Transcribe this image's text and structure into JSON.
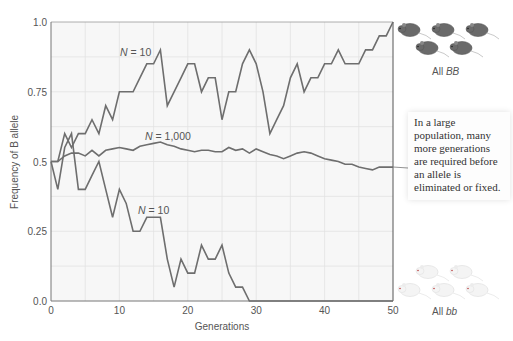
{
  "chart_data": {
    "type": "line",
    "title": "",
    "xlabel": "Generations",
    "ylabel": "Frequency of B allele",
    "xlim": [
      0,
      50
    ],
    "ylim": [
      0.0,
      1.0
    ],
    "x_ticks": [
      "0",
      "10",
      "20",
      "30",
      "40",
      "50"
    ],
    "y_ticks": [
      "0.0",
      "0.25",
      "0.5",
      "0.75",
      "1.0"
    ],
    "grid": true,
    "x": [
      0,
      1,
      2,
      3,
      4,
      5,
      6,
      7,
      8,
      9,
      10,
      11,
      12,
      13,
      14,
      15,
      16,
      17,
      18,
      19,
      20,
      21,
      22,
      23,
      24,
      25,
      26,
      27,
      28,
      29,
      30,
      31,
      32,
      33,
      34,
      35,
      36,
      37,
      38,
      39,
      40,
      41,
      42,
      43,
      44,
      45,
      46,
      47,
      48,
      49,
      50
    ],
    "series": [
      {
        "name": "N = 10 (fixed)",
        "label": "N = 10",
        "values": [
          0.5,
          0.5,
          0.6,
          0.55,
          0.6,
          0.6,
          0.65,
          0.6,
          0.7,
          0.65,
          0.75,
          0.75,
          0.75,
          0.8,
          0.85,
          0.85,
          0.9,
          0.7,
          0.75,
          0.8,
          0.85,
          0.85,
          0.75,
          0.8,
          0.8,
          0.65,
          0.75,
          0.75,
          0.85,
          0.9,
          0.85,
          0.75,
          0.6,
          0.65,
          0.7,
          0.8,
          0.85,
          0.75,
          0.8,
          0.8,
          0.85,
          0.85,
          0.9,
          0.85,
          0.85,
          0.85,
          0.9,
          0.9,
          0.95,
          0.95,
          1.0
        ]
      },
      {
        "name": "N = 1,000",
        "label": "N = 1,000",
        "values": [
          0.5,
          0.5,
          0.52,
          0.53,
          0.53,
          0.52,
          0.54,
          0.52,
          0.54,
          0.545,
          0.55,
          0.545,
          0.54,
          0.555,
          0.56,
          0.565,
          0.57,
          0.56,
          0.555,
          0.545,
          0.54,
          0.535,
          0.54,
          0.54,
          0.535,
          0.535,
          0.55,
          0.54,
          0.545,
          0.53,
          0.545,
          0.535,
          0.525,
          0.52,
          0.51,
          0.52,
          0.53,
          0.535,
          0.53,
          0.52,
          0.51,
          0.505,
          0.5,
          0.49,
          0.49,
          0.48,
          0.475,
          0.47,
          0.48,
          0.48,
          0.48
        ]
      },
      {
        "name": "N = 10 (lost)",
        "label": "N = 10",
        "values": [
          0.5,
          0.4,
          0.55,
          0.6,
          0.4,
          0.4,
          0.45,
          0.5,
          0.4,
          0.3,
          0.4,
          0.35,
          0.25,
          0.25,
          0.3,
          0.3,
          0.3,
          0.15,
          0.05,
          0.15,
          0.1,
          0.1,
          0.2,
          0.15,
          0.15,
          0.2,
          0.1,
          0.05,
          0.05,
          0.0,
          0.0,
          0.0,
          0.0,
          0.0,
          0.0,
          0.0,
          0.0,
          0.0,
          0.0,
          0.0,
          0.0,
          0.0,
          0.0,
          0.0,
          0.0,
          0.0,
          0.0,
          0.0,
          0.0,
          0.0,
          0.0
        ]
      }
    ],
    "annotations": [
      "In a large population, many more generations are required before an allele is eliminated or fixed.",
      "All BB",
      "All bb"
    ],
    "line_color": "#6e6e6e"
  },
  "labels": {
    "series_top": "N = 10",
    "series_mid": "N = 1,000",
    "series_bottom": "N = 10",
    "xlabel": "Generations",
    "ylabel": "Frequency of B allele",
    "note": "In a large population, many more generations are required before an allele is eliminated or fixed.",
    "all_BB_prefix": "All ",
    "all_BB_genotype": "BB",
    "all_bb_prefix": "All ",
    "all_bb_genotype": "bb"
  },
  "icons": {
    "top_right": "dark-mouse-icon",
    "bottom_right": "white-mouse-icon"
  }
}
